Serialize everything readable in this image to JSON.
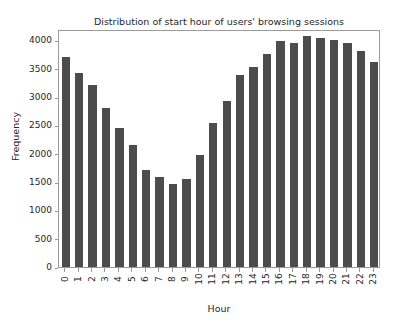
{
  "chart_data": {
    "type": "bar",
    "title": "Distribution of start hour of users' browsing sessions",
    "xlabel": "Hour",
    "ylabel": "Frequency",
    "categories": [
      "0",
      "1",
      "2",
      "3",
      "4",
      "5",
      "6",
      "7",
      "8",
      "9",
      "10",
      "11",
      "12",
      "13",
      "14",
      "15",
      "16",
      "17",
      "18",
      "19",
      "20",
      "21",
      "22",
      "23"
    ],
    "values": [
      3700,
      3430,
      3205,
      2805,
      2450,
      2155,
      1705,
      1595,
      1470,
      1560,
      1985,
      2535,
      2930,
      3385,
      3525,
      3755,
      3985,
      3955,
      4070,
      4040,
      4000,
      3950,
      3805,
      3615
    ],
    "ylim": [
      0,
      4200
    ],
    "yticks": [
      0,
      500,
      1000,
      1500,
      2000,
      2500,
      3000,
      3500,
      4000
    ],
    "ytick_labels": [
      "0",
      "500",
      "1000",
      "1500",
      "2000",
      "2500",
      "3000",
      "3500",
      "4000"
    ],
    "grid": false,
    "legend": null,
    "bar_color": "#4c4c4c",
    "axes_color": "#9a9a9a",
    "text_color": "#262626",
    "background": "#ffffff",
    "xtick_rotation": 90
  }
}
